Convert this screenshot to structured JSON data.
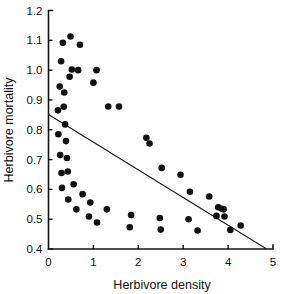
{
  "chart_data": {
    "type": "scatter",
    "title": "",
    "xlabel": "Herbivore density",
    "ylabel": "Herbivore mortality",
    "xlim": [
      0,
      5
    ],
    "ylim": [
      0.4,
      1.2
    ],
    "xticks": [
      "0",
      "1",
      "2",
      "3",
      "4",
      "5"
    ],
    "xtick_values": [
      0,
      1,
      2,
      3,
      4,
      5
    ],
    "yticks": [
      "0.4",
      "0.5",
      "0.6",
      "0.7",
      "0.8",
      "0.9",
      "1.0",
      "1.1",
      "1.2"
    ],
    "ytick_values": [
      0.4,
      0.5,
      0.6,
      0.7,
      0.8,
      0.9,
      1.0,
      1.1,
      1.2
    ],
    "grid": false,
    "legend": false,
    "marker": "filled-circle",
    "marker_color": "#111111",
    "series": [
      {
        "name": "observations",
        "points": [
          [
            0.21,
            0.865
          ],
          [
            0.22,
            0.785
          ],
          [
            0.25,
            0.945
          ],
          [
            0.26,
            0.715
          ],
          [
            0.28,
            1.03
          ],
          [
            0.29,
            0.655
          ],
          [
            0.3,
            0.605
          ],
          [
            0.32,
            1.092
          ],
          [
            0.34,
            0.877
          ],
          [
            0.35,
            0.925
          ],
          [
            0.37,
            0.818
          ],
          [
            0.39,
            0.762
          ],
          [
            0.41,
            0.705
          ],
          [
            0.43,
            0.66
          ],
          [
            0.44,
            0.566
          ],
          [
            0.47,
            0.978
          ],
          [
            0.49,
            1.113
          ],
          [
            0.52,
            1.002
          ],
          [
            0.56,
            0.617
          ],
          [
            0.62,
            0.533
          ],
          [
            0.66,
            1.0
          ],
          [
            0.7,
            1.085
          ],
          [
            0.76,
            0.584
          ],
          [
            0.9,
            0.509
          ],
          [
            0.93,
            0.556
          ],
          [
            1.0,
            0.958
          ],
          [
            1.07,
            1.0
          ],
          [
            1.08,
            0.489
          ],
          [
            1.3,
            0.533
          ],
          [
            1.33,
            0.878
          ],
          [
            1.57,
            0.878
          ],
          [
            1.81,
            0.473
          ],
          [
            1.84,
            0.514
          ],
          [
            2.18,
            0.773
          ],
          [
            2.25,
            0.754
          ],
          [
            2.48,
            0.504
          ],
          [
            2.5,
            0.465
          ],
          [
            2.52,
            0.672
          ],
          [
            2.94,
            0.649
          ],
          [
            3.12,
            0.5
          ],
          [
            3.15,
            0.592
          ],
          [
            3.32,
            0.462
          ],
          [
            3.58,
            0.576
          ],
          [
            3.74,
            0.511
          ],
          [
            3.78,
            0.54
          ],
          [
            3.86,
            0.535
          ],
          [
            3.9,
            0.533
          ],
          [
            3.92,
            0.509
          ],
          [
            4.05,
            0.464
          ],
          [
            4.28,
            0.479
          ]
        ]
      }
    ],
    "fit_line": {
      "name": "regression-line",
      "x_start": 0.0,
      "y_start": 0.851,
      "x_end": 4.85,
      "y_end": 0.401,
      "color": "#1a1a1a"
    }
  }
}
